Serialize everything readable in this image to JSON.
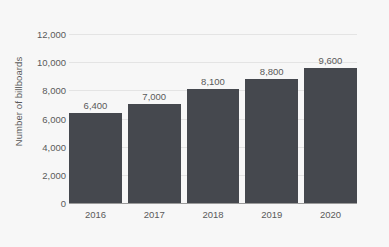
{
  "chart_data": {
    "type": "bar",
    "title": "",
    "subtitle": "",
    "xlabel": "",
    "ylabel": "Number of billboards",
    "categories": [
      "2016",
      "2017",
      "2018",
      "2019",
      "2020"
    ],
    "values": [
      6400,
      7000,
      8100,
      8800,
      9600
    ],
    "value_labels": [
      "6,400",
      "7,000",
      "8,100",
      "8,800",
      "9,600"
    ],
    "ylim": [
      0,
      12000
    ],
    "ytick_values": [
      0,
      2000,
      4000,
      6000,
      8000,
      10000,
      12000
    ],
    "ytick_labels": [
      "0",
      "2,000",
      "4,000",
      "6,000",
      "8,000",
      "10,000",
      "12,000"
    ],
    "grid": true,
    "grid_axis": "y",
    "legend": false,
    "legend_position": "none",
    "orientation": "vertical",
    "data_labels": true,
    "colors": {
      "bar": "#45484e",
      "background": "#f7f7f7",
      "gridline": "#e4e4e4",
      "axis_line": "#9a9a9a",
      "text": "#5a5a5a"
    }
  }
}
